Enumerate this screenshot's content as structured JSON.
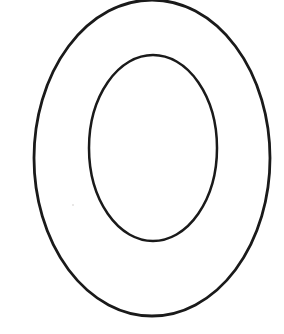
{
  "document": {
    "kind": "letter-outline-worksheet",
    "title": "Letter O Outline",
    "letter": "O",
    "case": "uppercase",
    "background_color": "#ffffff",
    "width": 284,
    "height": 334
  },
  "artwork": {
    "name": "capital-letter-o",
    "description": "Hollow capital letter O drawn as two concentric egg-shaped outlines",
    "stroke_color": "#1a1a1a",
    "fill_color": "#ffffff",
    "stroke_width": 2.6,
    "shapes": [
      {
        "name": "outer-contour",
        "type": "ellipse",
        "cx": 152,
        "cy": 158,
        "rx": 118,
        "ry": 158,
        "stroke_width": 2.8,
        "note": "top edge clipped by the image border"
      },
      {
        "name": "inner-contour",
        "type": "ellipse",
        "cx": 153,
        "cy": 148,
        "rx": 64,
        "ry": 93,
        "stroke_width": 2.5,
        "note": "counter / hole of the letter"
      }
    ],
    "artifacts": [
      {
        "name": "scan-speck",
        "x": 72,
        "y": 204,
        "color": "#d8d6d4"
      }
    ]
  }
}
